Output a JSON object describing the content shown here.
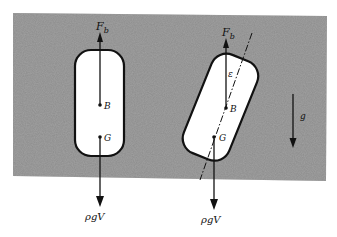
{
  "diagram": {
    "colors": {
      "fluid": "#8a8a8a",
      "body": "#ffffff",
      "ink": "#111111",
      "background": "#ffffff"
    },
    "upright_body": {
      "buoyancy_label": "F",
      "buoyancy_sub": "b",
      "center_of_buoyancy": "B",
      "center_of_gravity": "G",
      "weight_label": "ρgV"
    },
    "tilted_body": {
      "buoyancy_label": "F",
      "buoyancy_sub": "b",
      "tilt_angle_label": "ε",
      "center_of_buoyancy": "B",
      "center_of_gravity": "G",
      "weight_label": "ρgV"
    },
    "gravity": {
      "label": "g"
    }
  }
}
